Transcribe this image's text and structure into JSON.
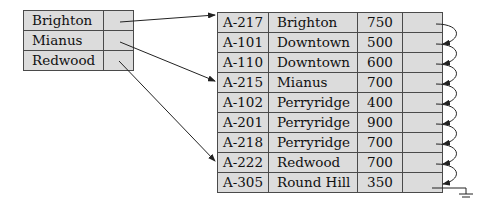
{
  "index": {
    "entries": [
      {
        "key": "Brighton"
      },
      {
        "key": "Mianus"
      },
      {
        "key": "Redwood"
      }
    ]
  },
  "file": {
    "records": [
      {
        "account": "A-217",
        "branch": "Brighton",
        "balance": "750"
      },
      {
        "account": "A-101",
        "branch": "Downtown",
        "balance": "500"
      },
      {
        "account": "A-110",
        "branch": "Downtown",
        "balance": "600"
      },
      {
        "account": "A-215",
        "branch": "Mianus",
        "balance": "700"
      },
      {
        "account": "A-102",
        "branch": "Perryridge",
        "balance": "400"
      },
      {
        "account": "A-201",
        "branch": "Perryridge",
        "balance": "900"
      },
      {
        "account": "A-218",
        "branch": "Perryridge",
        "balance": "700"
      },
      {
        "account": "A-222",
        "branch": "Redwood",
        "balance": "700"
      },
      {
        "account": "A-305",
        "branch": "Round Hill",
        "balance": "350"
      }
    ]
  },
  "colors": {
    "cell_fill": "#dcdcdc",
    "border": "#4a4a4a",
    "arrow": "#222222"
  }
}
